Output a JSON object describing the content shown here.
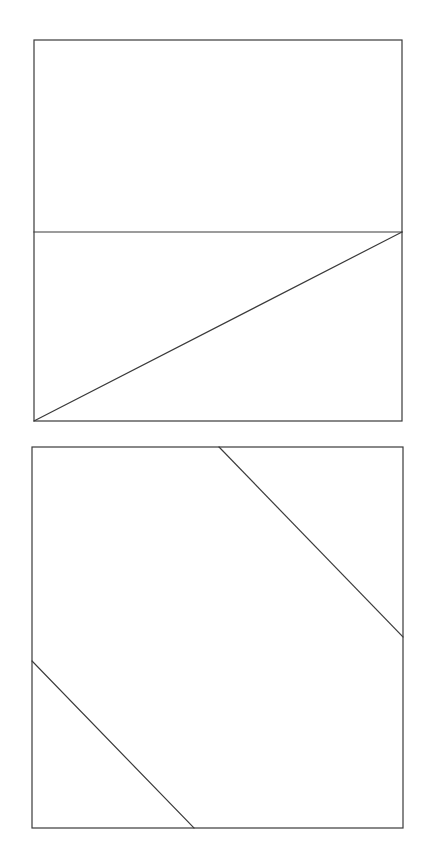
{
  "canvas": {
    "width": 428,
    "height": 866,
    "background": "#ffffff"
  },
  "style": {
    "stroke_color": "#3a3a3a",
    "stroke_width": 1.2
  },
  "figures": [
    {
      "name": "top-square",
      "rect": {
        "x1": 34,
        "y1": 40,
        "x2": 402,
        "y2": 421
      },
      "lines": [
        {
          "name": "horizontal-divider",
          "x1": 34,
          "y1": 232,
          "x2": 402,
          "y2": 232
        },
        {
          "name": "diagonal",
          "x1": 402,
          "y1": 232,
          "x2": 34,
          "y2": 421
        }
      ]
    },
    {
      "name": "bottom-square",
      "rect": {
        "x1": 32,
        "y1": 447,
        "x2": 403,
        "y2": 828
      },
      "lines": [
        {
          "name": "upper-right-diagonal",
          "x1": 219,
          "y1": 447,
          "x2": 403,
          "y2": 637
        },
        {
          "name": "lower-left-diagonal",
          "x1": 32,
          "y1": 661,
          "x2": 194,
          "y2": 828
        }
      ]
    }
  ]
}
